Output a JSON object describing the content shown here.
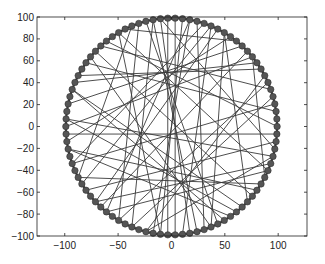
{
  "chart_data": {
    "type": "scatter",
    "title": "",
    "xlabel": "",
    "ylabel": "",
    "xlim": [
      -126,
      127
    ],
    "ylim": [
      -100,
      100
    ],
    "grid": false,
    "legend": null,
    "x_ticks": [
      -100,
      -50,
      0,
      50,
      100
    ],
    "y_ticks": [
      -100,
      -80,
      -60,
      -40,
      -20,
      0,
      20,
      40,
      60,
      80,
      100
    ],
    "x_tick_labels": [
      "−100",
      "−50",
      "0",
      "50",
      "100"
    ],
    "y_tick_labels": [
      "−100",
      "−80",
      "−60",
      "−40",
      "−20",
      "0",
      "20",
      "40",
      "60",
      "80",
      "100"
    ],
    "nodes": {
      "count": 90,
      "center": [
        0,
        0
      ],
      "radius": 99,
      "marker": "filled circle",
      "color": "#555555"
    },
    "edges": [
      [
        22,
        68
      ],
      [
        23,
        67
      ],
      [
        24,
        70
      ],
      [
        21,
        66
      ],
      [
        25,
        62
      ],
      [
        20,
        58
      ],
      [
        26,
        74
      ],
      [
        19,
        72
      ],
      [
        27,
        60
      ],
      [
        28,
        52
      ],
      [
        30,
        84
      ],
      [
        32,
        0
      ],
      [
        33,
        5
      ],
      [
        34,
        80
      ],
      [
        36,
        2
      ],
      [
        38,
        8
      ],
      [
        40,
        78
      ],
      [
        42,
        12
      ],
      [
        44,
        86
      ],
      [
        45,
        10
      ],
      [
        47,
        14
      ],
      [
        48,
        76
      ],
      [
        50,
        18
      ],
      [
        52,
        82
      ],
      [
        54,
        88
      ],
      [
        56,
        16
      ],
      [
        58,
        84
      ],
      [
        60,
        6
      ],
      [
        62,
        4
      ],
      [
        64,
        86
      ],
      [
        65,
        20
      ],
      [
        66,
        30
      ],
      [
        69,
        17
      ],
      [
        71,
        25
      ],
      [
        73,
        35
      ],
      [
        75,
        40
      ],
      [
        77,
        44
      ],
      [
        79,
        15
      ],
      [
        81,
        48
      ],
      [
        83,
        10
      ],
      [
        85,
        56
      ],
      [
        87,
        24
      ],
      [
        89,
        46
      ],
      [
        3,
        50
      ],
      [
        7,
        64
      ],
      [
        9,
        39
      ],
      [
        11,
        57
      ],
      [
        13,
        29
      ],
      [
        15,
        73
      ],
      [
        17,
        53
      ]
    ],
    "colors": {
      "edge": "#3a3a3a",
      "node": "#555555",
      "axis": "#222222",
      "background": "#ffffff"
    }
  }
}
